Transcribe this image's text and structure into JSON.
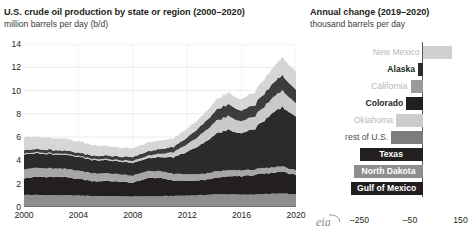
{
  "left": {
    "title": "U.S. crude oil production by state or region (2000–2020)",
    "subtitle": "million barrels per day (b/d)",
    "y_ticks": [
      "0",
      "2",
      "4",
      "6",
      "8",
      "10",
      "12",
      "14"
    ],
    "x_ticks": [
      "2000",
      "2004",
      "2008",
      "2012",
      "2016",
      "2020"
    ]
  },
  "right": {
    "title": "Annual change (2019–2020)",
    "subtitle": "thousand barrels per day",
    "x_ticks": [
      "–250",
      "–50",
      "150"
    ],
    "logo_text": "eia"
  },
  "chart_data": [
    {
      "type": "area",
      "title": "U.S. crude oil production by state or region (2000–2020)",
      "subtitle": "million barrels per day (b/d)",
      "xlabel": "",
      "ylabel": "million barrels per day (b/d)",
      "ylim": [
        0,
        14
      ],
      "xlim": [
        2000,
        2021
      ],
      "grid": true,
      "stacked": true,
      "legend": "none",
      "x": [
        2000,
        2001,
        2002,
        2003,
        2004,
        2005,
        2006,
        2007,
        2008,
        2009,
        2010,
        2011,
        2012,
        2013,
        2014,
        2015,
        2016,
        2017,
        2018,
        2019,
        2020
      ],
      "series": [
        {
          "name": "rest of U.S.",
          "color": "#8e8e8e",
          "values": [
            1.05,
            1.03,
            1.02,
            1.0,
            0.98,
            0.95,
            0.93,
            0.92,
            0.9,
            0.92,
            0.93,
            0.95,
            0.98,
            1.02,
            1.08,
            1.1,
            1.05,
            1.08,
            1.12,
            1.15,
            1.08
          ]
        },
        {
          "name": "Gulf of Mexico",
          "color": "#231f20",
          "values": [
            1.44,
            1.55,
            1.56,
            1.56,
            1.46,
            1.28,
            1.3,
            1.28,
            1.15,
            1.56,
            1.55,
            1.32,
            1.27,
            1.26,
            1.4,
            1.53,
            1.6,
            1.68,
            1.77,
            1.9,
            1.65
          ]
        },
        {
          "name": "California",
          "color": "#a6a6a6",
          "values": [
            0.79,
            0.76,
            0.74,
            0.72,
            0.7,
            0.68,
            0.66,
            0.64,
            0.62,
            0.6,
            0.58,
            0.57,
            0.55,
            0.54,
            0.54,
            0.53,
            0.5,
            0.48,
            0.47,
            0.45,
            0.4
          ]
        },
        {
          "name": "Texas",
          "color": "#2b2b2b",
          "values": [
            1.28,
            1.25,
            1.22,
            1.2,
            1.17,
            1.14,
            1.11,
            1.09,
            1.1,
            1.1,
            1.18,
            1.43,
            1.92,
            2.53,
            3.17,
            3.46,
            3.19,
            3.52,
            4.41,
            5.07,
            4.68
          ]
        },
        {
          "name": "North Dakota",
          "color": "#c9c9c9",
          "values": [
            0.09,
            0.09,
            0.08,
            0.08,
            0.08,
            0.1,
            0.11,
            0.12,
            0.17,
            0.22,
            0.3,
            0.42,
            0.66,
            0.86,
            1.08,
            1.17,
            1.03,
            1.06,
            1.25,
            1.43,
            1.15
          ]
        },
        {
          "name": "Colorado + Oklahoma",
          "color": "#3d3d3d",
          "values": [
            0.28,
            0.28,
            0.28,
            0.28,
            0.28,
            0.28,
            0.29,
            0.3,
            0.33,
            0.36,
            0.4,
            0.46,
            0.58,
            0.74,
            0.92,
            1.02,
            0.92,
            1.0,
            1.18,
            1.33,
            1.15
          ]
        },
        {
          "name": "Alaska + New Mexico",
          "color": "#d6d6d6",
          "values": [
            1.13,
            1.05,
            1.02,
            1.0,
            0.98,
            0.92,
            0.82,
            0.79,
            0.76,
            0.75,
            0.73,
            0.72,
            0.74,
            0.78,
            0.86,
            0.95,
            0.98,
            1.09,
            1.28,
            1.52,
            1.54
          ]
        }
      ]
    },
    {
      "type": "bar",
      "orientation": "horizontal",
      "title": "Annual change (2019–2020)",
      "subtitle": "thousand barrels per day",
      "xlabel": "thousand barrels per day",
      "ylabel": "",
      "xlim": [
        -310,
        170
      ],
      "x_ticks": [
        -250,
        -50,
        150
      ],
      "grid": false,
      "categories": [
        "New Mexico",
        "Alaska",
        "California",
        "Colorado",
        "Oklahoma",
        "rest of U.S.",
        "Texas",
        "North Dakota",
        "Gulf of Mexico"
      ],
      "values": [
        115,
        -18,
        -48,
        -65,
        -105,
        -125,
        -250,
        -270,
        -285
      ],
      "bar_colors": [
        "#d0d0d0",
        "#2b2b2b",
        "#9a9a9a",
        "#231f20",
        "#cccccc",
        "#7d7d7d",
        "#231f20",
        "#8e8e8e",
        "#231f20"
      ],
      "label_styles": [
        "faint",
        "strong",
        "faint",
        "strong",
        "faint",
        "mid",
        "inside",
        "inside",
        "inside"
      ]
    }
  ]
}
